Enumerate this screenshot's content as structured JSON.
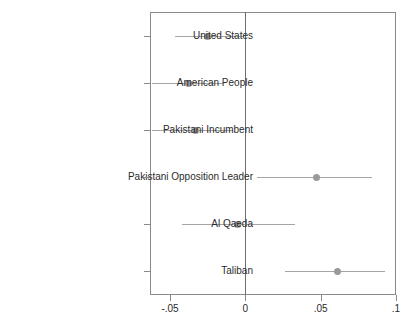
{
  "chart_data": {
    "type": "scatter",
    "title": "",
    "subtitle": "",
    "xlabel": "",
    "ylabel": "",
    "orientation": "horizontal",
    "grid": false,
    "legend": null,
    "xlim": [
      -0.0633,
      0.1
    ],
    "xticks": [
      -0.05,
      0,
      0.05,
      0.1
    ],
    "xticklabels": [
      "-.05",
      "0",
      ".05",
      ".1"
    ],
    "reference_line": 0,
    "categories": [
      "United States",
      "American People",
      "Pakistani Incumbent",
      "Pakistani Opposition Leader",
      "Al Qaeda",
      "Taliban"
    ],
    "points": [
      {
        "label": "United States",
        "estimate": -0.025,
        "ci_low": -0.047,
        "ci_high": -0.001
      },
      {
        "label": "American People",
        "estimate": -0.038,
        "ci_low": -0.062,
        "ci_high": -0.015
      },
      {
        "label": "Pakistani Incumbent",
        "estimate": -0.033,
        "ci_low": -0.062,
        "ci_high": -0.008
      },
      {
        "label": "Pakistani Opposition Leader",
        "estimate": 0.047,
        "ci_low": 0.008,
        "ci_high": 0.084
      },
      {
        "label": "Al Qaeda",
        "estimate": -0.005,
        "ci_low": -0.042,
        "ci_high": 0.033
      },
      {
        "label": "Taliban",
        "estimate": 0.061,
        "ci_low": 0.026,
        "ci_high": 0.093
      }
    ],
    "colors": {
      "marker": "#9a9a9a",
      "whisker": "#a5a5a5",
      "frame": "#8a8a8a",
      "zero_line": "#6e6e6e",
      "text": "#2b2b2b"
    }
  },
  "caption": {
    "text": ""
  }
}
